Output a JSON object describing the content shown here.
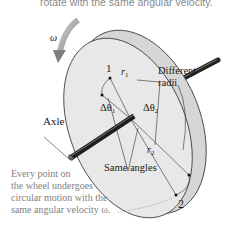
{
  "header": {
    "caption_fragment": "rotate with the same angular velocity."
  },
  "diagram": {
    "omega_label": "ω",
    "point1_label": "1",
    "point2_label": "2",
    "r1_label": "r",
    "r1_sub": "1",
    "r2_label": "r",
    "r2_sub": "2",
    "dtheta1_label": "Δθ",
    "dtheta1_sub": "1",
    "dtheta2_label": "Δθ",
    "dtheta2_sub": "2",
    "different_radii_line1": "Different",
    "different_radii_line2": "radii",
    "axle_label": "Axle",
    "same_angles_label": "Same angles"
  },
  "note": {
    "line1": "Every point on",
    "line2": "the wheel undergoes",
    "line3": "circular motion with the",
    "line4": "same angular velocity ω."
  },
  "colors": {
    "wheel_face": "#e6e6e6",
    "wheel_rim": "#d4d4d4",
    "outline": "#3a3a3a",
    "axle": "#222222",
    "arrow": "#8c8c8c",
    "note_text": "#7f7f7f"
  }
}
